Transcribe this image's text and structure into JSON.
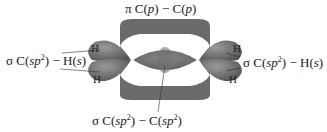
{
  "labels": {
    "top": {
      "prefix": "π",
      "text1": " C(",
      "p1": "p",
      "text2": ") − C(",
      "p2": "p",
      "text3": ")"
    },
    "left": {
      "prefix": "σ",
      "text1": " C(",
      "sp": "sp",
      "exp": "2",
      "text2": ") − H(",
      "s": "s",
      "text3": ")"
    },
    "right": {
      "prefix": "σ",
      "text1": " C(",
      "sp": "sp",
      "exp": "2",
      "text2": ") − H(",
      "s": "s",
      "text3": ")"
    },
    "bottom": {
      "prefix": "σ",
      "text1": " C(",
      "sp1": "sp",
      "exp1": "2",
      "text2": ") − C(",
      "sp2": "sp",
      "exp2": "2",
      "text3": ")"
    }
  },
  "atoms": {
    "h_label": "H"
  },
  "colors": {
    "lobe": "#6e6e6e",
    "lobe_dark": "#4f4f4f",
    "lobe_light": "#8c8c8c",
    "text": "#1a1a1a"
  }
}
